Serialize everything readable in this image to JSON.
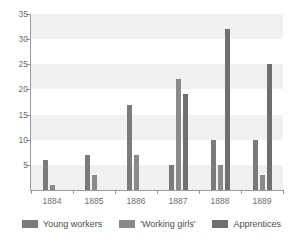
{
  "figure": {
    "title_fragment": "",
    "background_color": "#ffffff"
  },
  "chart_data": {
    "type": "bar",
    "title": "",
    "subtitle": "",
    "xlabel": "",
    "ylabel": "",
    "categories": [
      "1884",
      "1885",
      "1886",
      "1887",
      "1888",
      "1889"
    ],
    "series": [
      {
        "name": "Young workers",
        "color": "#7b7b7d",
        "values": [
          6,
          7,
          17,
          5,
          10,
          10
        ]
      },
      {
        "name": "'Working girls'",
        "color": "#8a8a8c",
        "values": [
          1,
          3,
          7,
          22,
          5,
          3
        ]
      },
      {
        "name": "Apprentices",
        "color": "#6f6f71",
        "values": [
          0,
          0,
          0,
          19,
          32,
          25
        ]
      }
    ],
    "ylim": [
      0,
      35
    ],
    "yticks": [
      5,
      10,
      15,
      20,
      25,
      30,
      35
    ],
    "ytick_labels": [
      "5",
      "10",
      "15",
      "20",
      "25",
      "30",
      "35"
    ],
    "grid": "alternating-horizontal-bands",
    "band_color": "#f1f1f1",
    "legend_position": "bottom-center"
  },
  "legend": {
    "items": [
      {
        "label": "Young workers",
        "color": "#7b7b7d"
      },
      {
        "label": "'Working girls'",
        "color": "#8a8a8c"
      },
      {
        "label": "Apprentices",
        "color": "#6f6f71"
      }
    ]
  },
  "axis": {
    "y_tick_labels": [
      "35",
      "30",
      "25",
      "20",
      "15",
      "10",
      "5"
    ],
    "x_tick_labels": [
      "1884",
      "1885",
      "1886",
      "1887",
      "1888",
      "1889"
    ],
    "axis_color": "#9a9a9c",
    "label_color": "#6d6d6f"
  }
}
